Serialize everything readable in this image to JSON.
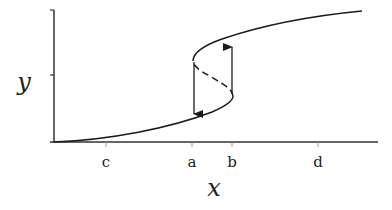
{
  "diagram": {
    "type": "hysteresis-s-curve",
    "axes": {
      "x_label": "x",
      "y_label": "y",
      "x_ticks": [
        {
          "label": "c",
          "x": 106
        },
        {
          "label": "a",
          "x": 192
        },
        {
          "label": "b",
          "x": 232
        },
        {
          "label": "d",
          "x": 318
        }
      ]
    },
    "branches": {
      "lower_stable": "solid",
      "middle_unstable": "dashed",
      "upper_stable": "solid"
    },
    "transitions": [
      {
        "at": "a",
        "direction": "down"
      },
      {
        "at": "b",
        "direction": "up"
      }
    ],
    "colors": {
      "stroke": "#1a1a1a",
      "axis": "#333333",
      "background": "#ffffff"
    }
  }
}
